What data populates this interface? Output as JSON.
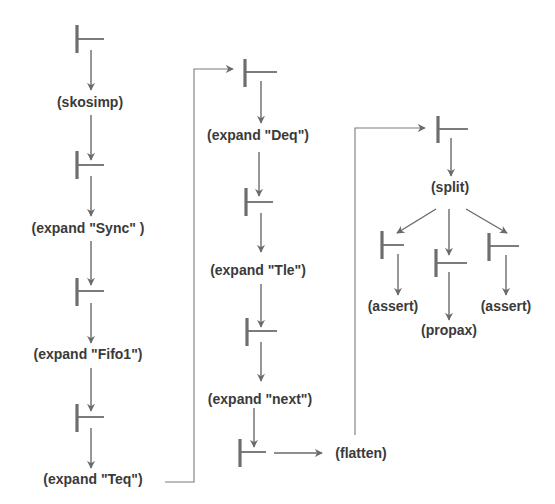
{
  "diagram": {
    "type": "proof-tree",
    "symbol": "turnstile",
    "colors": {
      "line": "#6a6a6a",
      "text": "#3a3a3a",
      "background": "#ffffff"
    },
    "nodes": [
      {
        "id": "t1",
        "kind": "sequent",
        "x": 77,
        "y": 38
      },
      {
        "id": "r1",
        "kind": "rule",
        "label": "(skosimp)",
        "x": 90,
        "y": 107
      },
      {
        "id": "t2",
        "kind": "sequent",
        "x": 77,
        "y": 164
      },
      {
        "id": "r2",
        "kind": "rule",
        "label": "(expand \"Sync\" )",
        "x": 90,
        "y": 233
      },
      {
        "id": "t3",
        "kind": "sequent",
        "x": 77,
        "y": 291
      },
      {
        "id": "r3",
        "kind": "rule",
        "label": "(expand \"Fifo1\")",
        "x": 90,
        "y": 359
      },
      {
        "id": "t4",
        "kind": "sequent",
        "x": 77,
        "y": 416
      },
      {
        "id": "r4",
        "kind": "rule",
        "label": "(expand \"Teq\")",
        "x": 93,
        "y": 484
      },
      {
        "id": "t5",
        "kind": "sequent",
        "x": 245,
        "y": 72
      },
      {
        "id": "r5",
        "kind": "rule",
        "label": "(expand \"Deq\")",
        "x": 258,
        "y": 140
      },
      {
        "id": "t6",
        "kind": "sequent",
        "x": 245,
        "y": 200
      },
      {
        "id": "r6",
        "kind": "rule",
        "label": "(expand \"Tle\")",
        "x": 258,
        "y": 268
      },
      {
        "id": "t7",
        "kind": "sequent",
        "x": 246,
        "y": 330
      },
      {
        "id": "r7",
        "kind": "rule",
        "label": "(expand \"next\")",
        "x": 260,
        "y": 399
      },
      {
        "id": "t8",
        "kind": "sequent",
        "x": 241,
        "y": 452
      },
      {
        "id": "r8",
        "kind": "rule",
        "label": "(flatten)",
        "x": 363,
        "y": 458
      },
      {
        "id": "t9",
        "kind": "sequent",
        "x": 439,
        "y": 127
      },
      {
        "id": "r9",
        "kind": "rule",
        "label": "(split)",
        "x": 449,
        "y": 192
      },
      {
        "id": "t10",
        "kind": "sequent",
        "x": 382,
        "y": 244
      },
      {
        "id": "t11",
        "kind": "sequent",
        "x": 436,
        "y": 262
      },
      {
        "id": "t12",
        "kind": "sequent",
        "x": 490,
        "y": 246
      },
      {
        "id": "r10",
        "kind": "rule",
        "label": "(assert)",
        "x": 395,
        "y": 309
      },
      {
        "id": "r11",
        "kind": "rule",
        "label": "(propax)",
        "x": 449,
        "y": 334
      },
      {
        "id": "r12",
        "kind": "rule",
        "label": "(assert)",
        "x": 506,
        "y": 309
      }
    ]
  }
}
